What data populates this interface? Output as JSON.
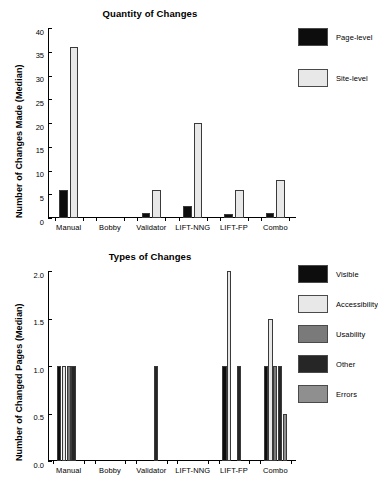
{
  "figure": {
    "width": 364,
    "height": 489
  },
  "colors": {
    "visible": "#0d0d0d",
    "accessibility": "#e8e8e8",
    "usability": "#7a7a7a",
    "other": "#262626",
    "errors": "#8f8f8f",
    "page_level": "#0d0d0d",
    "site_level": "#e8e8e8",
    "axis": "#000000",
    "background": "#ffffff"
  },
  "chart_data": [
    {
      "id": "quantity-of-changes",
      "type": "bar",
      "title": "Quantity of Changes",
      "xlabel": "",
      "ylabel": "Number of Changes Made (Median)",
      "ylim": [
        0,
        40
      ],
      "yticks": [
        "0",
        "5",
        "10",
        "15",
        "20",
        "25",
        "30",
        "35",
        "40"
      ],
      "ytick_values": [
        0,
        5,
        10,
        15,
        20,
        25,
        30,
        35,
        40
      ],
      "grid": false,
      "legend_position": "right",
      "categories": [
        "Manual",
        "Bobby",
        "Validator",
        "LIFT-NNG",
        "LIFT-FP",
        "Combo"
      ],
      "series": [
        {
          "name": "Page-level",
          "color_key": "page_level",
          "values": [
            6,
            0,
            1,
            2.5,
            0.8,
            1
          ]
        },
        {
          "name": "Site-level",
          "color_key": "site_level",
          "values": [
            36,
            0,
            6,
            20,
            6,
            8
          ]
        }
      ]
    },
    {
      "id": "types-of-changes",
      "type": "bar",
      "title": "Types of Changes",
      "xlabel": "",
      "ylabel": "Number of Changed Pages (Median)",
      "ylim": [
        0,
        2.0
      ],
      "yticks": [
        "0.0",
        "0.5",
        "1.0",
        "1.5",
        "2.0"
      ],
      "ytick_values": [
        0,
        0.5,
        1.0,
        1.5,
        2.0
      ],
      "grid": false,
      "legend_position": "right",
      "categories": [
        "Manual",
        "Bobby",
        "Validator",
        "LIFT-NNG",
        "LIFT-FP",
        "Combo"
      ],
      "series": [
        {
          "name": "Visible",
          "color_key": "visible",
          "values": [
            1,
            0,
            0,
            0,
            1,
            1
          ]
        },
        {
          "name": "Accessibility",
          "color_key": "accessibility",
          "values": [
            1,
            0,
            0,
            0,
            2,
            1.5
          ]
        },
        {
          "name": "Usability",
          "color_key": "usability",
          "values": [
            1,
            0,
            0,
            0,
            0,
            1
          ]
        },
        {
          "name": "Other",
          "color_key": "other",
          "values": [
            1,
            0,
            1,
            0,
            1,
            1
          ]
        },
        {
          "name": "Errors",
          "color_key": "errors",
          "values": [
            0,
            0,
            0,
            0,
            0,
            0.5
          ]
        }
      ]
    }
  ]
}
